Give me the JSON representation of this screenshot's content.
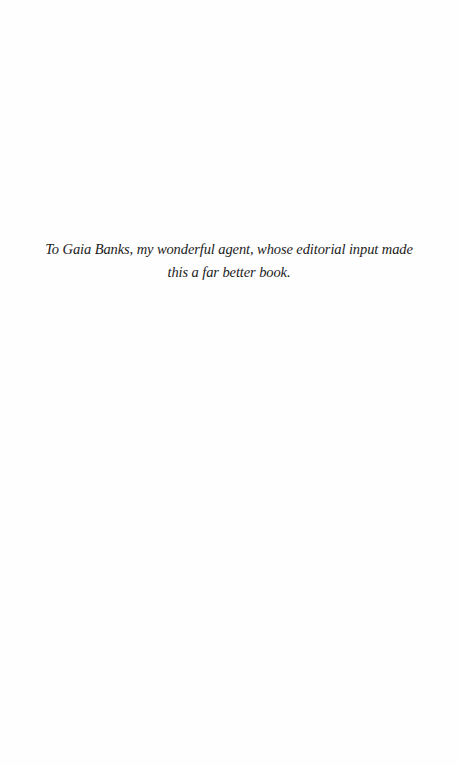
{
  "page": {
    "type": "dedication",
    "background": "#fefefe",
    "text_color": "#1c1c1c"
  },
  "dedication": {
    "text": "To Gaia Banks, my wonderful agent, whose editorial input made this a far better book."
  }
}
